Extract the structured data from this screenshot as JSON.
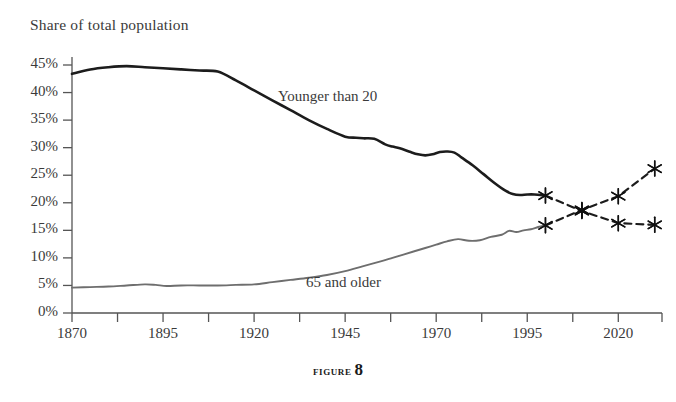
{
  "figure": {
    "caption_word": "Figure",
    "caption_number": "8"
  },
  "chart_data": {
    "type": "line",
    "title": "Share of total population",
    "xlabel": "",
    "ylabel": "Share of total population",
    "xlim": [
      1870,
      2032
    ],
    "ylim": [
      0,
      45
    ],
    "grid": false,
    "legend": "inline-labels",
    "ytick_labels": [
      "0%",
      "5%",
      "10%",
      "15%",
      "20%",
      "25%",
      "30%",
      "35%",
      "40%",
      "45%"
    ],
    "ytick_values": [
      0,
      5,
      10,
      15,
      20,
      25,
      30,
      35,
      40,
      45
    ],
    "xtick_labels": [
      "1870",
      "1895",
      "1920",
      "1945",
      "1970",
      "1995",
      "2020"
    ],
    "xtick_values": [
      1870,
      1895,
      1920,
      1945,
      1970,
      1995,
      2020
    ],
    "xtick_minor_values": [
      1882.5,
      1907.5,
      1932.5,
      1957.5,
      1982.5,
      2007.5,
      2032
    ],
    "series": [
      {
        "name": "Younger than 20",
        "label": "Younger than 20",
        "color": "#1c1c1c",
        "style": "solid",
        "x": [
          1870,
          1875,
          1880,
          1885,
          1890,
          1895,
          1900,
          1905,
          1910,
          1915,
          1920,
          1925,
          1930,
          1935,
          1940,
          1945,
          1948,
          1950,
          1953,
          1956,
          1958,
          1960,
          1963,
          1965,
          1967,
          1969,
          1971,
          1973,
          1975,
          1977,
          1980,
          1983,
          1986,
          1989,
          1991,
          1993,
          1995,
          1997,
          2000
        ],
        "values": [
          43.4,
          44.2,
          44.6,
          44.8,
          44.6,
          44.4,
          44.2,
          44.0,
          43.8,
          42.2,
          40.4,
          38.6,
          36.8,
          35.0,
          33.4,
          32.0,
          31.8,
          31.7,
          31.6,
          30.6,
          30.2,
          29.9,
          29.2,
          28.8,
          28.6,
          28.8,
          29.2,
          29.3,
          29.1,
          28.2,
          26.8,
          25.2,
          23.6,
          22.2,
          21.6,
          21.4,
          21.5,
          21.5,
          21.3
        ]
      },
      {
        "name": "65 and older",
        "label": "65 and older",
        "color": "#6e6e6e",
        "style": "solid",
        "x": [
          1870,
          1875,
          1880,
          1885,
          1890,
          1893,
          1896,
          1900,
          1905,
          1910,
          1915,
          1920,
          1925,
          1930,
          1935,
          1940,
          1945,
          1950,
          1955,
          1958,
          1961,
          1964,
          1967,
          1970,
          1973,
          1976,
          1979,
          1982,
          1985,
          1988,
          1990,
          1992,
          1994,
          1996,
          1998,
          2000
        ],
        "values": [
          4.6,
          4.7,
          4.8,
          5.0,
          5.2,
          5.1,
          4.9,
          5.0,
          5.0,
          5.0,
          5.1,
          5.2,
          5.6,
          6.0,
          6.4,
          6.9,
          7.6,
          8.5,
          9.4,
          10.0,
          10.6,
          11.2,
          11.8,
          12.4,
          13.0,
          13.4,
          13.1,
          13.2,
          13.8,
          14.2,
          14.9,
          14.7,
          15.0,
          15.2,
          15.6,
          15.9
        ]
      },
      {
        "name": "Younger than 20 (projected)",
        "label": "Younger than 20 (projected)",
        "color": "#1c1c1c",
        "style": "dashed",
        "markers": "asterisk",
        "x": [
          2000,
          2010,
          2020,
          2030
        ],
        "values": [
          21.3,
          18.5,
          16.3,
          16.0
        ]
      },
      {
        "name": "65 and older (projected)",
        "label": "65 and older (projected)",
        "color": "#1c1c1c",
        "style": "dashed",
        "markers": "asterisk",
        "x": [
          2000,
          2010,
          2020,
          2030
        ],
        "values": [
          15.9,
          18.7,
          21.2,
          26.2
        ]
      }
    ],
    "annotations": [
      {
        "text": "Younger than 20",
        "x": 1944,
        "y": 37.5
      },
      {
        "text": "65 and older",
        "x": 1950,
        "y": 3.3
      }
    ]
  }
}
